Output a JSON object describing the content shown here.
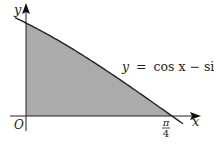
{
  "figure": {
    "axes": {
      "x_label": "x",
      "y_label": "y",
      "origin_label": "O",
      "x_tick": {
        "numerator": "π",
        "denominator": "4"
      }
    },
    "curve": {
      "equation_lhs": "y",
      "equation_eq": "=",
      "equation_rhs": "cos x − sin x"
    },
    "shading_color": "#ababab",
    "curve_color": "#222222"
  }
}
